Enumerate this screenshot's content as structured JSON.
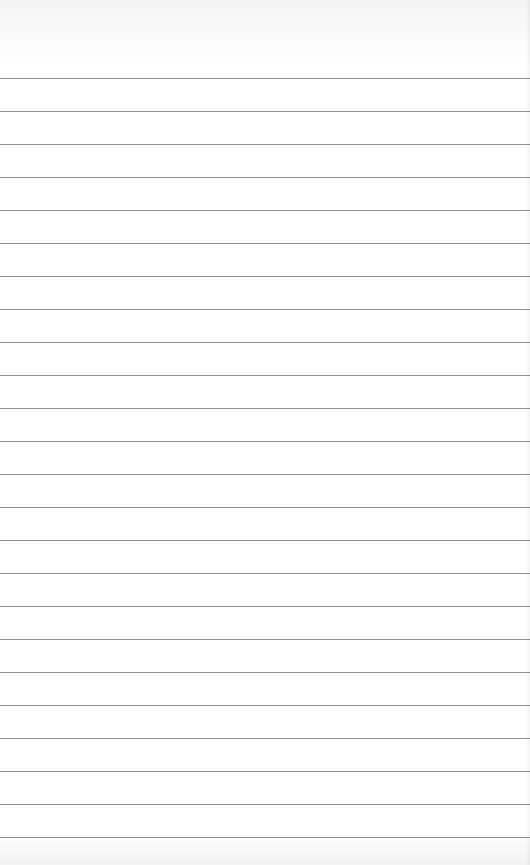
{
  "page": {
    "type": "lined-paper",
    "background_color": "#ffffff",
    "rule_color": "#8f8f8f",
    "first_rule_y": 78,
    "rule_spacing": 33,
    "rule_count": 24
  }
}
